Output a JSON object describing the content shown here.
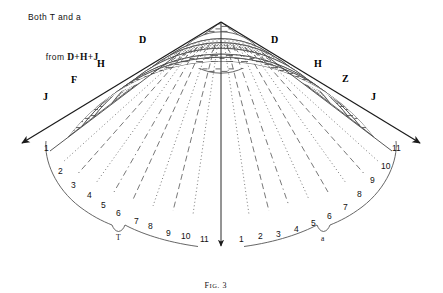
{
  "figure": {
    "caption_prefix": "F",
    "caption_small": "IG.",
    "caption_number": "3",
    "caption_full": "FIG. 3",
    "annotation": {
      "line1": "Both T and a",
      "line2_prefix": "from ",
      "line2_symbols": "D+H+J",
      "line2_full": "from D+H+J"
    },
    "apex": {
      "x": 221,
      "y": 22
    },
    "colors": {
      "ink": "#1a1a1a",
      "line": "#333333",
      "hatch": "#555555",
      "background": "#ffffff"
    },
    "edge_labels": [
      {
        "text": "D",
        "side": "left",
        "x": 142,
        "y": 40
      },
      {
        "text": "D",
        "side": "right",
        "x": 274,
        "y": 40
      },
      {
        "text": "H",
        "side": "left",
        "x": 100,
        "y": 64
      },
      {
        "text": "H",
        "side": "right",
        "x": 317,
        "y": 64
      },
      {
        "text": "F",
        "side": "left",
        "x": 73,
        "y": 80
      },
      {
        "text": "Z",
        "side": "right",
        "x": 345,
        "y": 79
      },
      {
        "text": "J",
        "side": "left",
        "x": 45,
        "y": 97
      },
      {
        "text": "J",
        "side": "right",
        "x": 374,
        "y": 97
      }
    ],
    "scales": {
      "left": {
        "brace_label": "T",
        "numbers": [
          "1",
          "2",
          "3",
          "4",
          "5",
          "6",
          "7",
          "8",
          "9",
          "10",
          "11"
        ]
      },
      "right": {
        "brace_label": "a",
        "numbers": [
          "1",
          "2",
          "3",
          "4",
          "5",
          "6",
          "7",
          "8",
          "9",
          "10",
          "11"
        ]
      }
    },
    "arrows": [
      {
        "name": "left-arrow",
        "direction": "down-left"
      },
      {
        "name": "right-arrow",
        "direction": "down-right"
      },
      {
        "name": "center-arrow",
        "direction": "down"
      }
    ],
    "bands": [
      {
        "index": 0,
        "pattern": "horizontal-dash"
      },
      {
        "index": 1,
        "pattern": "radial-dash"
      },
      {
        "index": 2,
        "pattern": "stipple"
      },
      {
        "index": 3,
        "pattern": "stipple-dense"
      },
      {
        "index": 4,
        "pattern": "blank"
      },
      {
        "index": 5,
        "pattern": "horizontal-dash"
      },
      {
        "index": 6,
        "pattern": "horizontal-dash"
      },
      {
        "index": 7,
        "pattern": "blank"
      }
    ]
  }
}
